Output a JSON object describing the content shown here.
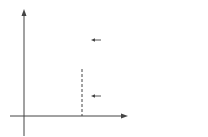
{
  "diagram": {
    "type": "function-graph",
    "axes": {
      "x_label": "x",
      "y_label": "y"
    },
    "x_ticks": [
      "1",
      "3",
      "4"
    ],
    "y_ticks": [
      "3"
    ],
    "functions": [
      {
        "name": "f",
        "label": "f(x)=x²−4x+3",
        "expr": "x^2-4x+3"
      },
      {
        "name": "g",
        "label": "g(x)=−x²+4x+3",
        "expr": "-x^2+4x+3"
      }
    ],
    "shaded_region": "between g (top) and f (bottom) from x=0 to x=4",
    "dashed_line_x": 4,
    "colors": {
      "line": "#444444",
      "shading_dot": "#9a9a9a",
      "background": "#ffffff"
    }
  },
  "labels": {
    "y_axis": "y",
    "x_axis": "x",
    "tick_1": "1",
    "tick_3": "3",
    "tick_4": "4",
    "y_tick_3": "3",
    "f_label_name": "f",
    "f_label_rest": "(x)=x",
    "f_label_sup": "2",
    "f_label_tail": "−4x+3",
    "g_label_name": "g",
    "g_label_rest": "(x)=−x",
    "g_label_sup": "2",
    "g_label_tail": "+4x+3"
  }
}
